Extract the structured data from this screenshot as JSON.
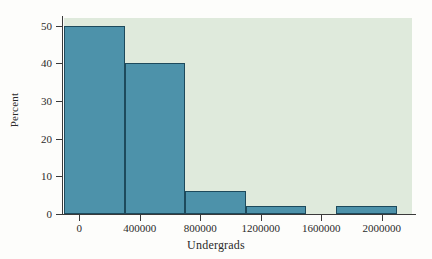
{
  "chart_data": {
    "type": "bar",
    "title": "",
    "subtitle": "",
    "xlabel": "Undergrads",
    "ylabel": "Percent",
    "grid": false,
    "legend": false,
    "legend_position": "none",
    "xlim": [
      -100000,
      2200000
    ],
    "ylim": [
      0,
      52
    ],
    "bin_width": 200000,
    "bar_color": "#4d92aa",
    "bar_edge_color": "#1d4a5c",
    "plot_background": "#dfeadc",
    "figure_background": "#fdfdfb",
    "xticks": [
      0,
      400000,
      800000,
      1200000,
      1600000,
      2000000
    ],
    "xtick_labels": [
      "0",
      "400000",
      "800000",
      "1200000",
      "1600000",
      "2000000"
    ],
    "yticks": [
      0,
      10,
      20,
      30,
      40,
      50
    ],
    "ytick_labels": [
      "0",
      "10",
      "20",
      "30",
      "40",
      "50"
    ],
    "bins": [
      {
        "x0": -100000,
        "x1": 100000,
        "value": 50
      },
      {
        "x0": 100000,
        "x1": 300000,
        "value": 50
      },
      {
        "x0": 300000,
        "x1": 500000,
        "value": 40
      },
      {
        "x0": 500000,
        "x1": 700000,
        "value": 40
      },
      {
        "x0": 700000,
        "x1": 900000,
        "value": 6
      },
      {
        "x0": 900000,
        "x1": 1100000,
        "value": 6
      },
      {
        "x0": 1100000,
        "x1": 1300000,
        "value": 2
      },
      {
        "x0": 1300000,
        "x1": 1500000,
        "value": 2
      },
      {
        "x0": 1500000,
        "x1": 1700000,
        "value": 0
      },
      {
        "x0": 1700000,
        "x1": 1900000,
        "value": 2
      },
      {
        "x0": 1900000,
        "x1": 2100000,
        "value": 2
      }
    ],
    "values": [
      50,
      40,
      6,
      2,
      0,
      2
    ],
    "categories": [
      "-100000 to 300000",
      "300000 to 700000",
      "700000 to 1100000",
      "1100000 to 1500000",
      "1500000 to 1800000",
      "1800000 to 2200000"
    ]
  }
}
